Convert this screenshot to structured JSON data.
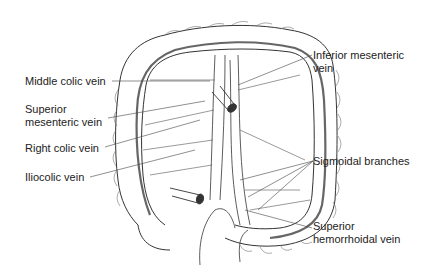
{
  "diagram": {
    "labels": {
      "middle_colic": "Middle colic vein",
      "superior_mesenteric_1": "Superior",
      "superior_mesenteric_2": "mesenteric vein",
      "right_colic": "Right colic vein",
      "iliocolic": "Iliocolic vein",
      "inferior_mesenteric_1": "Inferior mesenteric",
      "inferior_mesenteric_2": "vein",
      "sigmoidal": "Sigmoidal branches",
      "superior_hemorrhoidal_1": "Superior",
      "superior_hemorrhoidal_2": "hemorrhoidal vein"
    },
    "colors": {
      "line": "#333333",
      "text": "#222222",
      "background": "#ffffff"
    }
  }
}
